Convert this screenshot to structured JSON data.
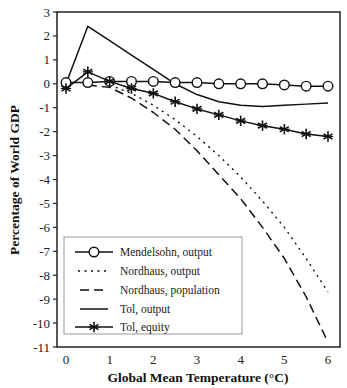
{
  "chart_data": {
    "type": "line",
    "title": "",
    "xlabel": "Global Mean Temperature (°C)",
    "ylabel": "Percentage of World GDP",
    "xlim": [
      0,
      6
    ],
    "ylim": [
      -11,
      3
    ],
    "xticks": [
      0,
      1,
      2,
      3,
      4,
      5,
      6
    ],
    "yticks": [
      3,
      2,
      1,
      0,
      -1,
      -2,
      -3,
      -4,
      -5,
      -6,
      -7,
      -8,
      -9,
      -10,
      -11
    ],
    "grid": false,
    "legend_position": "lower left (inside)",
    "x": [
      0,
      0.5,
      1,
      1.5,
      2,
      2.5,
      3,
      3.5,
      4,
      4.5,
      5,
      5.5,
      6
    ],
    "series": [
      {
        "name": "Mendelsohn, output",
        "style": "solid-circle-markers",
        "x": [
          0,
          0.5,
          1,
          1.5,
          2,
          2.5,
          3,
          3.5,
          4,
          4.5,
          5,
          5.5,
          6
        ],
        "values": [
          0.05,
          0.05,
          0.1,
          0.1,
          0.1,
          0.05,
          0.05,
          0.0,
          0.0,
          0.0,
          -0.05,
          -0.1,
          -0.1
        ]
      },
      {
        "name": "Nordhaus, output",
        "style": "dotted",
        "x": [
          1,
          1.5,
          2,
          2.5,
          3,
          3.5,
          4,
          4.5,
          5,
          5.5,
          6
        ],
        "values": [
          -0.05,
          -0.4,
          -0.9,
          -1.5,
          -2.2,
          -3.0,
          -3.9,
          -4.9,
          -6.0,
          -7.3,
          -8.7
        ]
      },
      {
        "name": "Nordhaus, population",
        "style": "dashed",
        "x": [
          0.5,
          1,
          1.5,
          2,
          2.5,
          3,
          3.5,
          4,
          4.5,
          5,
          5.5,
          6
        ],
        "values": [
          -0.05,
          -0.15,
          -0.6,
          -1.2,
          -1.9,
          -2.8,
          -3.8,
          -4.8,
          -6.0,
          -7.3,
          -8.9,
          -10.8
        ]
      },
      {
        "name": "Tol, output",
        "style": "solid",
        "x": [
          0,
          0.5,
          1,
          1.5,
          2,
          2.5,
          3,
          3.5,
          4,
          4.5,
          5,
          5.5,
          6
        ],
        "values": [
          0.0,
          2.4,
          1.8,
          1.2,
          0.6,
          0.0,
          -0.45,
          -0.75,
          -0.9,
          -0.95,
          -0.9,
          -0.85,
          -0.8
        ]
      },
      {
        "name": "Tol, equity",
        "style": "solid-asterisk-markers",
        "x": [
          0,
          0.5,
          1,
          1.5,
          2,
          2.5,
          3,
          3.5,
          4,
          4.5,
          5,
          5.5,
          6
        ],
        "values": [
          -0.2,
          0.5,
          0.1,
          -0.2,
          -0.4,
          -0.75,
          -1.05,
          -1.3,
          -1.55,
          -1.75,
          -1.9,
          -2.1,
          -2.2
        ]
      }
    ]
  },
  "legend": {
    "items": [
      {
        "label": "Mendelsohn, output"
      },
      {
        "label": "Nordhaus, output"
      },
      {
        "label": "Nordhaus, population"
      },
      {
        "label": "Tol, output"
      },
      {
        "label": "Tol, equity"
      }
    ]
  },
  "axes": {
    "x_title": "Global Mean Temperature (°C)",
    "y_title": "Percentage of World GDP"
  },
  "colors": {
    "line": "#111111",
    "frame": "#222222",
    "legend_border": "#999999"
  }
}
